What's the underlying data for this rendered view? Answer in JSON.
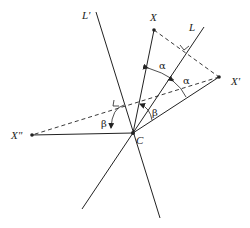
{
  "diagram": {
    "points": {
      "C": {
        "label": "C",
        "x": 133,
        "y": 133
      },
      "X": {
        "label": "X",
        "x": 154,
        "y": 30
      },
      "X1": {
        "label": "X'",
        "x": 219,
        "y": 77
      },
      "X2": {
        "label": "X\"",
        "x": 32,
        "y": 135
      }
    },
    "lines": {
      "L": {
        "label": "L",
        "x1": 82,
        "y1": 209,
        "x2": 204,
        "y2": 27
      },
      "L_prime": {
        "label": "L'",
        "x1": 96,
        "y1": 12,
        "x2": 160,
        "y2": 218
      }
    },
    "angles": {
      "alpha_1": "α",
      "alpha_2": "α",
      "beta_1": "β",
      "beta_2": "β"
    },
    "colors": {
      "stroke": "#222222",
      "background": "#ffffff"
    }
  }
}
